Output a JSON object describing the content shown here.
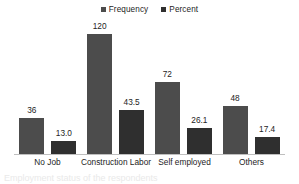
{
  "chart_data": {
    "type": "bar",
    "title": "",
    "xlabel": "",
    "ylabel": "",
    "categories": [
      "No Job",
      "Construction Labor",
      "Self employed",
      "Others"
    ],
    "series": [
      {
        "name": "Frequency",
        "color": "#4c4c4c",
        "values": [
          36,
          120,
          72,
          48
        ],
        "labels": [
          "36",
          "120",
          "72",
          "48"
        ]
      },
      {
        "name": "Percent",
        "color": "#2f2f2f",
        "values": [
          13.0,
          43.5,
          26.1,
          17.4
        ],
        "labels": [
          "13.0",
          "43.5",
          "26.1",
          "17.4"
        ]
      }
    ],
    "ylim": [
      0,
      132
    ],
    "grid": false,
    "legend_position": "top-center",
    "axis_color": "#bfbfbf"
  },
  "legend": {
    "items": [
      {
        "label": "Frequency",
        "swatch": "legend-swatch-frequency"
      },
      {
        "label": "Percent",
        "swatch": "legend-swatch-percent"
      }
    ]
  },
  "caption": {
    "text": "Employment status of the respondents"
  }
}
